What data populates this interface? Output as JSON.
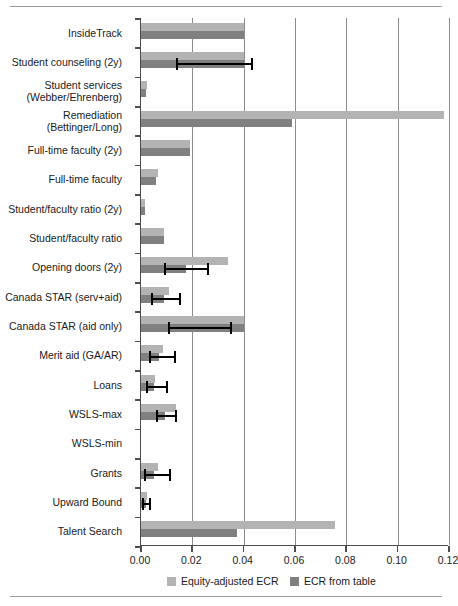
{
  "chart_data": {
    "type": "bar",
    "orientation": "horizontal",
    "title": "",
    "xlabel": "",
    "ylabel": "",
    "xlim": [
      0.0,
      0.12
    ],
    "xticks": [
      0.0,
      0.02,
      0.04,
      0.06,
      0.08,
      0.1,
      0.12
    ],
    "xtick_labels": [
      "0.00",
      "0.02",
      "0.04",
      "0.06",
      "0.08",
      "0.10",
      "0.12"
    ],
    "grid": "vertical",
    "legend_position": "below-axis",
    "categories": [
      "InsideTrack",
      "Student counseling (2y)",
      "Student services\n(Webber/Ehrenberg)",
      "Remediation\n(Bettinger/Long)",
      "Full-time faculty (2y)",
      "Full-time faculty",
      "Student/faculty ratio (2y)",
      "Student/faculty ratio",
      "Opening doors (2y)",
      "Canada STAR (serv+aid)",
      "Canada STAR (aid only)",
      "Merit aid (GA/AR)",
      "Loans",
      "WSLS-max",
      "WSLS-min",
      "Grants",
      "Upward Bound",
      "Talent Search"
    ],
    "series": [
      {
        "name": "Equity-adjusted ECR",
        "color": "#b3b3b3",
        "values": [
          0.04,
          0.04,
          0.0025,
          0.118,
          0.019,
          0.0065,
          0.0015,
          0.009,
          0.034,
          0.011,
          0.04,
          0.0085,
          0.0055,
          0.0135,
          0.0,
          0.0065,
          0.0025,
          0.0755
        ]
      },
      {
        "name": "ECR from table",
        "color": "#808080",
        "values": [
          0.04,
          0.04,
          0.002,
          0.059,
          0.019,
          0.006,
          0.0015,
          0.009,
          0.0175,
          0.009,
          0.04,
          0.007,
          0.005,
          0.0095,
          0.0,
          0.005,
          0.002,
          0.0375
        ]
      }
    ],
    "error_bars": [
      null,
      {
        "low": 0.0135,
        "high": 0.0435
      },
      null,
      null,
      null,
      null,
      null,
      null,
      {
        "low": 0.009,
        "high": 0.0265
      },
      {
        "low": 0.004,
        "high": 0.0155
      },
      {
        "low": 0.0105,
        "high": 0.0355
      },
      {
        "low": 0.003,
        "high": 0.0135
      },
      {
        "low": 0.002,
        "high": 0.0105
      },
      {
        "low": 0.006,
        "high": 0.014
      },
      null,
      {
        "low": 0.001,
        "high": 0.0115
      },
      {
        "low": 0.0005,
        "high": 0.004
      },
      null
    ],
    "legend": [
      {
        "label": "Equity-adjusted ECR",
        "color": "#b3b3b3"
      },
      {
        "label": "ECR from table",
        "color": "#808080"
      }
    ]
  }
}
